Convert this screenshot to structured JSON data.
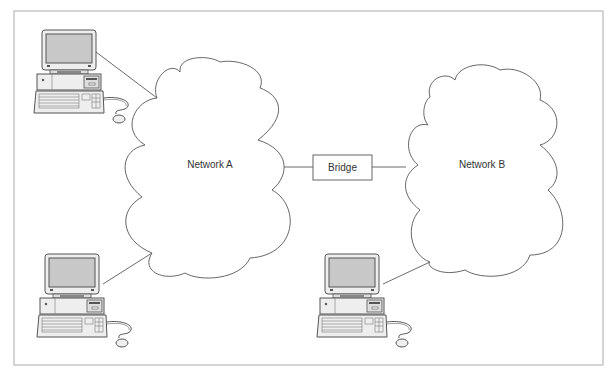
{
  "diagram": {
    "nodes": {
      "network_a": {
        "label": "Network A",
        "type": "cloud"
      },
      "network_b": {
        "label": "Network B",
        "type": "cloud"
      },
      "bridge": {
        "label": "Bridge",
        "type": "box"
      },
      "computers": [
        {
          "id": "pc-1",
          "connects_to": "network_a"
        },
        {
          "id": "pc-2",
          "connects_to": "network_a"
        },
        {
          "id": "pc-3",
          "connects_to": "network_b"
        }
      ]
    },
    "edges": [
      {
        "from": "pc-1",
        "to": "network_a"
      },
      {
        "from": "pc-2",
        "to": "network_a"
      },
      {
        "from": "pc-3",
        "to": "network_b"
      },
      {
        "from": "network_a",
        "to": "bridge"
      },
      {
        "from": "bridge",
        "to": "network_b"
      }
    ]
  },
  "colors": {
    "frame": "#aaaaaa",
    "line": "#444444",
    "screen": "#c8c8c8",
    "body": "#eeeeee"
  }
}
